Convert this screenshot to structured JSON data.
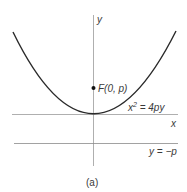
{
  "figure": {
    "caption": "(a)",
    "axes": {
      "x_label": "x",
      "y_label": "y"
    },
    "focus": {
      "label": "F(0, p)"
    },
    "curve": {
      "equation_base": "x",
      "equation_exp": "2",
      "equation_rest": " = 4py"
    },
    "directrix": {
      "label": "y = −p"
    },
    "colors": {
      "curve": "#2a2a2a",
      "axis": "#9a9a9a",
      "directrix": "#8a8a8a",
      "text": "#3a3a3a"
    }
  }
}
